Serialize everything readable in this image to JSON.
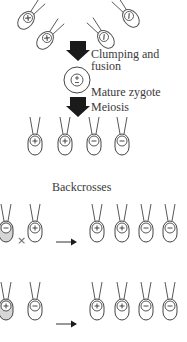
{
  "diagram": {
    "labels": {
      "clumping": "Clumping and",
      "fusion": "fusion",
      "zygote": "Mature zygote",
      "meiosis": "Meiosis",
      "backcrosses": "Backcrosses",
      "cross_symbol": "×"
    },
    "gametes_top": [
      {
        "mating_type": "×",
        "x": 28,
        "y": 18
      },
      {
        "mating_type": "×",
        "x": 47,
        "y": 38
      },
      {
        "mating_type": "/",
        "x": 104,
        "y": 37
      },
      {
        "mating_type": "/",
        "x": 129,
        "y": 16
      }
    ],
    "zygote": {
      "symbol": "±"
    },
    "meiosis_products": [
      "+",
      "+",
      "−",
      "−"
    ],
    "backcross_rows": [
      {
        "parent_shaded": "−",
        "parent": "+",
        "products": [
          "+",
          "+",
          "−",
          "−"
        ]
      },
      {
        "parent_shaded": "+",
        "parent": "−",
        "products": [
          "+",
          "+",
          "−",
          "−"
        ]
      }
    ],
    "colors": {
      "ink": "#3a3a3a",
      "arrow": "#1a1a1a",
      "shade": "#d8d8d8",
      "background": "#ffffff"
    }
  }
}
